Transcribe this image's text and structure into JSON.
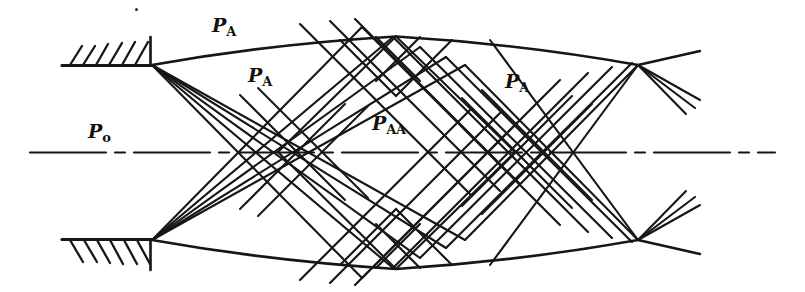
{
  "figure": {
    "ink_color": "#141414",
    "background_color": "#ffffff",
    "width": 805,
    "height": 292
  },
  "labels": {
    "p_a_top_left": {
      "base": "P",
      "sub": "A",
      "x": 212,
      "y": 22
    },
    "p_a_mid_left": {
      "base": "P",
      "sub": "A",
      "x": 248,
      "y": 72
    },
    "p_o_left": {
      "base": "P",
      "sub": "o",
      "x": 88,
      "y": 128
    },
    "p_aa_center": {
      "base": "P",
      "sub": "AA",
      "x": 372,
      "y": 120
    },
    "p_a_right": {
      "base": "P",
      "sub": "A",
      "x": 505,
      "y": 78
    }
  },
  "geometry": {
    "centerline_y": 152,
    "lip_top_left": {
      "x": 152,
      "y": 65
    },
    "lip_bottom_left": {
      "x": 152,
      "y": 240
    },
    "node_top_right": {
      "x": 638,
      "y": 65
    },
    "node_bottom_right": {
      "x": 638,
      "y": 240
    },
    "boundary_apex_top": {
      "x": 396,
      "y": 36
    },
    "boundary_apex_bottom": {
      "x": 396,
      "y": 270
    },
    "wall_top_left": {
      "x1": 62,
      "y": 65,
      "x2": 152
    },
    "wall_bottom_left": {
      "x1": 62,
      "y": 240,
      "x2": 152
    },
    "fan_line_count": 5,
    "exit_fan_count": 3
  },
  "annotations": {
    "hatching_top_label": "wall-hatching-top",
    "hatching_bottom_label": "wall-hatching-bottom",
    "centerline_style": "dash-dot axis of symmetry"
  }
}
